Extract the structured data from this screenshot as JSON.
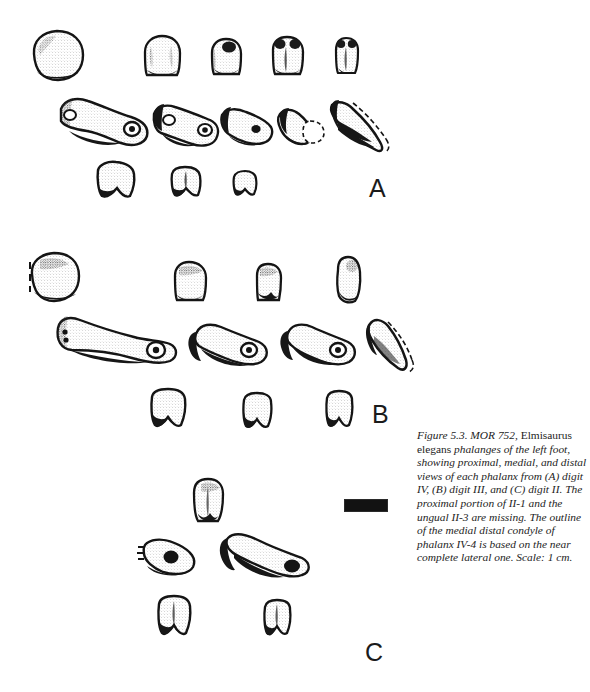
{
  "figure": {
    "number": "Figure 5.3.",
    "specimen": "MOR 752,",
    "taxon": "Elmisaurus elegans",
    "caption_full": "Figure 5.3. MOR 752, Elmisaurus elegans phalanges of the left foot, showing proximal, medial, and distal views of each phalanx from (A) digit IV, (B) digit III, and (C) digit II. The proximal portion of II-1 and the ungual II-3 are missing. The outline of the medial distal condyle of phalanx IV-4 is based on the near complete lateral one. Scale: 1 cm.",
    "caption_segments": [
      {
        "text": "Figure 5.3. MOR 752, ",
        "style": "italic"
      },
      {
        "text": "Elmisaurus elegans",
        "style": "roman"
      },
      {
        "text": " phalanges of the left foot, showing proximal, medial, and distal views of each phalanx from (A) digit IV, (B) digit III, and (C) digit II. The proximal portion of II-1 and the ungual II-3 are missing. The outline of the medial distal condyle of phalanx IV-4 is based on the near complete lateral one. Scale: 1 cm.",
        "style": "italic"
      }
    ],
    "scale": {
      "label": "Scale: 1 cm.",
      "length_cm": 1
    },
    "ink_color": "#1a1a1a",
    "background_color": "#ffffff"
  },
  "panels": [
    {
      "letter": "A",
      "digit": "digit IV",
      "rows": [
        {
          "view": "proximal",
          "count": 5
        },
        {
          "view": "medial",
          "count": 5,
          "note": "distal-most element is the ungual (claw); dashed outline shows reconstructed medial distal condyle of phalanx IV-4"
        },
        {
          "view": "distal",
          "count": 3
        }
      ]
    },
    {
      "letter": "B",
      "digit": "digit III",
      "rows": [
        {
          "view": "proximal",
          "count": 4
        },
        {
          "view": "medial",
          "count": 4,
          "note": "distal-most element is the ungual (claw) with dashed reconstruction"
        },
        {
          "view": "distal",
          "count": 3
        }
      ]
    },
    {
      "letter": "C",
      "digit": "digit II",
      "rows": [
        {
          "view": "proximal",
          "count": 1
        },
        {
          "view": "medial",
          "count": 2,
          "note": "proximal portion of II-1 missing, shown dashed; ungual II-3 is missing"
        },
        {
          "view": "distal",
          "count": 2
        }
      ]
    }
  ]
}
